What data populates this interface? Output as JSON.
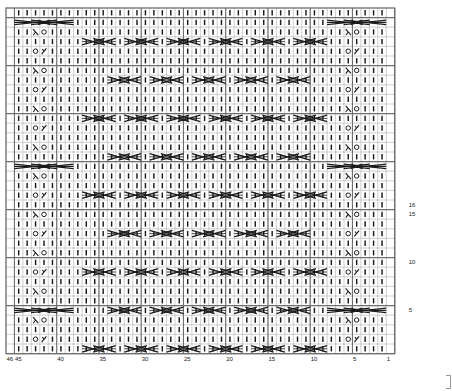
{
  "chart_title": "Knitting Stitch Chart",
  "chart_data": {
    "type": "heatmap",
    "xlabel": "",
    "ylabel": "",
    "grid": true,
    "legend_position": "none",
    "columns": 46,
    "rows": 36,
    "cell_width": 8.45,
    "cell_height": 9.6,
    "origin_x": 6,
    "origin_y": 8,
    "column_numbering_direction": "right-to-left",
    "row_numbering_direction": "bottom-to-top",
    "column_tick_labels": [
      "46",
      "45",
      "40",
      "35",
      "30",
      "25",
      "20",
      "15",
      "10",
      "5",
      "1"
    ],
    "column_tick_positions": [
      46,
      45,
      40,
      35,
      30,
      25,
      20,
      15,
      10,
      5,
      1
    ],
    "row_tick_labels": [
      "16",
      "15",
      "10",
      "5"
    ],
    "row_tick_positions": [
      16,
      15,
      10,
      5
    ],
    "symbols": {
      "knit": "|",
      "yarn_over": "O",
      "ssk": "λ",
      "k2tog": "∕",
      "cable_cross_4": "X",
      "twist_row": "=X="
    },
    "symbol_colors": {
      "stroke": "#1b1b1b",
      "grid_light": "#b9b9b9",
      "grid_heavy": "#6f6f6f",
      "background": "#ffffff"
    },
    "panels": [
      {
        "name": "left-lace-panel",
        "col_start": 39,
        "col_end": 45,
        "description": "7-stitch lace panel with alternating yarn-over / decrease pairs and periodic full-width twist rows"
      },
      {
        "name": "center-cable-field",
        "col_start": 9,
        "col_end": 38,
        "description": "Six 5-stitch cable repeats, crossing every 4 rows in alternating offset"
      },
      {
        "name": "right-lace-panel",
        "col_start": 2,
        "col_end": 8,
        "description": "Mirror of left lace panel"
      }
    ],
    "lace_sequence": [
      "plain",
      "O-right",
      "plain",
      "left-O",
      "twist",
      "plain",
      "left-O",
      "plain",
      "O-right",
      "plain",
      "left-O",
      "plain",
      "O-right",
      "plain",
      "left-O",
      "plain",
      "O-right",
      "plain",
      "left-O",
      "twist",
      "plain",
      "left-O",
      "plain",
      "O-right",
      "plain",
      "left-O",
      "plain",
      "O-right",
      "plain",
      "left-O",
      "plain",
      "O-right",
      "plain",
      "left-O",
      "twist",
      "plain"
    ],
    "cable_rows": [
      1,
      5,
      9,
      13,
      17,
      21,
      25,
      29,
      33
    ],
    "cable_repeat_count": 6,
    "cable_repeat_width": 5,
    "cable_span": 4
  },
  "footer": {
    "edge_marker": ""
  }
}
